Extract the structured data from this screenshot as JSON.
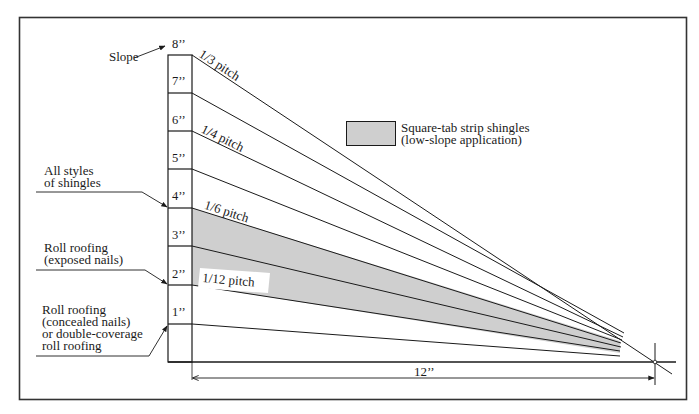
{
  "diagram": {
    "title_label": "Slope",
    "ruler": {
      "unit_labels": [
        "8’’",
        "7’’",
        "6’’",
        "5’’",
        "4’’",
        "3’’",
        "2’’",
        "1’’"
      ]
    },
    "pitch_labels": {
      "third": "1/3 pitch",
      "quarter": "1/4 pitch",
      "sixth": "1/6 pitch",
      "twelfth": "1/12 pitch"
    },
    "run_label": "12’’",
    "legend": {
      "swatch_color": "#cfcfcf",
      "line1": "Square-tab strip shingles",
      "line2": "(low-slope application)"
    },
    "callouts": {
      "all_styles": [
        "All styles",
        "of shingles"
      ],
      "roll_exposed": [
        "Roll roofing",
        "(exposed nails)"
      ],
      "roll_concealed": [
        "Roll roofing",
        "(concealed nails)",
        "or double-coverage",
        "roll roofing"
      ]
    },
    "colors": {
      "ink": "#1a1a1a",
      "shade": "#cfcfcf",
      "paper": "#ffffff"
    }
  }
}
